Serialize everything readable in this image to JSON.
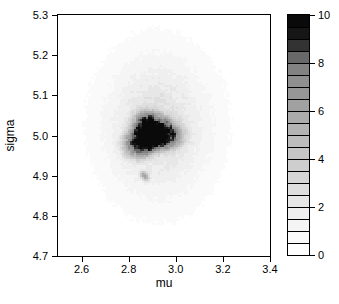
{
  "chart_data": {
    "type": "heatmap",
    "title": "",
    "xlabel": "mu",
    "ylabel": "sigma",
    "xlim": [
      2.5,
      3.4
    ],
    "ylim": [
      4.7,
      5.3
    ],
    "grid": false,
    "legend_position": "colorbar-right",
    "xticks": [
      2.6,
      2.8,
      3.0,
      3.2,
      3.4
    ],
    "xtick_labels": [
      "2.6",
      "2.8",
      "3.0",
      "3.2",
      "3.4"
    ],
    "yticks": [
      4.7,
      4.8,
      4.9,
      5.0,
      5.1,
      5.2,
      5.3
    ],
    "ytick_labels": [
      "4.7",
      "4.8",
      "4.9",
      "5.0",
      "5.1",
      "5.2",
      "5.3"
    ],
    "colorbar": {
      "min": 0,
      "max": 10,
      "step": 0.5,
      "ticks": [
        0,
        2,
        4,
        6,
        8,
        10
      ],
      "tick_labels": [
        "0",
        "2",
        "4",
        "6",
        "8",
        "10"
      ],
      "colors_low_to_high": [
        "#ffffff",
        "#fafafa",
        "#f5f5f5",
        "#efefef",
        "#e7e7e7",
        "#dedede",
        "#d6d6d6",
        "#cecece",
        "#c6c6c6",
        "#bdbdbd",
        "#b4b4b4",
        "#ababab",
        "#a1a1a1",
        "#969696",
        "#8f8f8f",
        "#828282",
        "#686868",
        "#333333",
        "#161616",
        "#0a0a0a"
      ]
    },
    "density_peaks": [
      {
        "label": "main-mode",
        "mu": 2.89,
        "sigma": 5.0,
        "peak_value": 10
      },
      {
        "label": "secondary-mode",
        "mu": 2.87,
        "sigma": 4.9,
        "peak_value": 5.5
      },
      {
        "label": "diffuse-cloud",
        "mu": 2.92,
        "sigma": 5.02,
        "peak_value": 2.9
      }
    ],
    "density_components": [
      {
        "shape": "supergauss",
        "mu": 2.895,
        "sigma": 5.004,
        "rx": 0.105,
        "ry": 0.054,
        "p": 4,
        "amp": 8.6,
        "wobble": [
          {
            "k": 2,
            "a": 0.1,
            "ph": 0.7
          },
          {
            "k": 3,
            "a": 0.14,
            "ph": 2.2
          },
          {
            "k": 1,
            "a": 0.05,
            "ph": 2.8
          }
        ]
      },
      {
        "shape": "gauss",
        "mu": 2.92,
        "sigma": 5.02,
        "rx": 0.21,
        "ry": 0.16,
        "p": 2,
        "amp": 2.1
      },
      {
        "shape": "gauss",
        "mu": 2.93,
        "sigma": 5.03,
        "rx": 0.3,
        "ry": 0.24,
        "p": 2,
        "amp": 0.8
      },
      {
        "shape": "gauss",
        "mu": 2.8605,
        "sigma": 4.9035,
        "rx": 0.014,
        "ry": 0.009,
        "p": 2,
        "amp": 3.3
      },
      {
        "shape": "gauss",
        "mu": 2.8755,
        "sigma": 4.8955,
        "rx": 0.014,
        "ry": 0.009,
        "p": 2,
        "amp": 3.3
      }
    ],
    "noise": {
      "amp": 0.13,
      "cell": 3
    }
  },
  "style": {
    "frame_color": "#000000",
    "background": "#ffffff",
    "text_color": "#000000"
  }
}
